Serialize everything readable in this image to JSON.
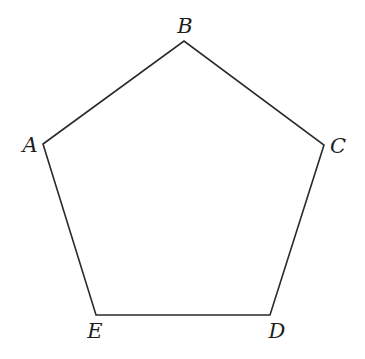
{
  "diagram": {
    "type": "regular-pentagon",
    "stroke_color": "#2a2a2a",
    "background": "#ffffff",
    "vertices": [
      {
        "label": "A",
        "x": 43,
        "y": 144,
        "label_x": 30,
        "label_y": 152
      },
      {
        "label": "B",
        "x": 184,
        "y": 41,
        "label_x": 185,
        "label_y": 33
      },
      {
        "label": "C",
        "x": 324,
        "y": 145,
        "label_x": 338,
        "label_y": 153
      },
      {
        "label": "D",
        "x": 270,
        "y": 315,
        "label_x": 277,
        "label_y": 338
      },
      {
        "label": "E",
        "x": 96,
        "y": 315,
        "label_x": 95,
        "label_y": 338
      }
    ],
    "edges": [
      [
        "A",
        "B"
      ],
      [
        "B",
        "C"
      ],
      [
        "C",
        "D"
      ],
      [
        "D",
        "E"
      ],
      [
        "E",
        "A"
      ]
    ]
  }
}
